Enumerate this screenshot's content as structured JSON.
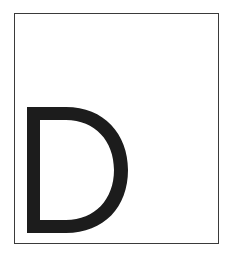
{
  "figure": {
    "letter": "D",
    "letter_color": "#1c1c1c",
    "frame_color": "#3a3a3a",
    "background": "#ffffff"
  }
}
